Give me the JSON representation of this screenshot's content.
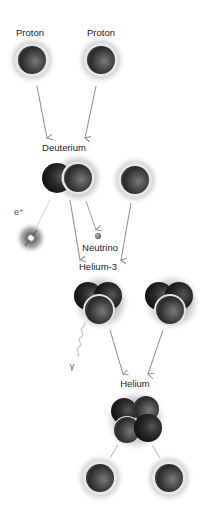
{
  "diagram": {
    "labels": {
      "proton_1": "Proton",
      "proton_2": "Proton",
      "deuterium": "Deuterium",
      "positron": "e⁺",
      "neutrino": "Neutrino",
      "helium3": "Helium-3",
      "gamma": "γ",
      "helium": "Helium"
    },
    "colors": {
      "arrow": "#8a8a8a",
      "halo": "#b5b5b5",
      "proton_core": "#4a4a4a",
      "neutron_core": "#1e1e1e",
      "label": "#222222",
      "background": "#ffffff"
    },
    "nodes": [
      {
        "id": "proton-1",
        "type": "proton",
        "x": 32,
        "y": 60
      },
      {
        "id": "proton-2",
        "type": "proton",
        "x": 101,
        "y": 60
      },
      {
        "id": "deuterium",
        "type": "deuterium",
        "x": 70,
        "y": 178
      },
      {
        "id": "proton-3",
        "type": "proton",
        "x": 135,
        "y": 180
      },
      {
        "id": "positron",
        "type": "positron",
        "x": 31,
        "y": 238
      },
      {
        "id": "neutrino",
        "type": "neutrino",
        "x": 98,
        "y": 236
      },
      {
        "id": "helium3-1",
        "type": "helium-3",
        "x": 98,
        "y": 302
      },
      {
        "id": "helium3-2",
        "type": "helium-3",
        "x": 170,
        "y": 302
      },
      {
        "id": "gamma",
        "type": "gamma-ray",
        "x": 70,
        "y": 345
      },
      {
        "id": "helium",
        "type": "helium-4",
        "x": 136,
        "y": 420
      },
      {
        "id": "proton-out-1",
        "type": "proton",
        "x": 100,
        "y": 478
      },
      {
        "id": "proton-out-2",
        "type": "proton",
        "x": 169,
        "y": 478
      }
    ]
  }
}
